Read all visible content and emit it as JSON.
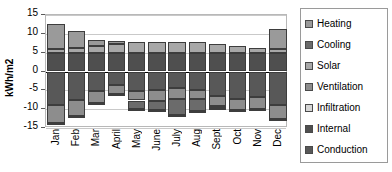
{
  "chart_data": {
    "type": "bar",
    "title": "",
    "subtitle": "",
    "xlabel": "",
    "ylabel": "kWh/m2",
    "stacked": true,
    "orientation": "vertical",
    "grid": true,
    "legend_position": "right",
    "ylim": [
      -15,
      15
    ],
    "yticks": [
      15,
      10,
      5,
      0,
      -5,
      -10,
      -15
    ],
    "ytick_labels": [
      "15",
      "10",
      "5",
      "0",
      "-5",
      "-10",
      "-15"
    ],
    "categories": [
      "Jan",
      "Feb",
      "Mar",
      "April",
      "May",
      "June",
      "July",
      "Aug",
      "Sept",
      "Oct",
      "Nov",
      "Dec"
    ],
    "series": [
      {
        "name": "Heating",
        "color": "#9a9a9a",
        "values": [
          6.7,
          4.5,
          1.7,
          0.8,
          0.0,
          0.0,
          0.0,
          0.0,
          0.0,
          0.0,
          0.0,
          5.4
        ]
      },
      {
        "name": "Cooling",
        "color": "#6b6b6b",
        "values": [
          0.0,
          0.0,
          0.0,
          0.0,
          -2.2,
          -2.3,
          -4.4,
          -3.2,
          -0.6,
          0.0,
          0.0,
          0.0
        ]
      },
      {
        "name": "Solar",
        "color": "#a8a8a8",
        "values": [
          1.0,
          1.3,
          1.8,
          2.4,
          2.8,
          2.9,
          3.0,
          2.9,
          2.5,
          2.0,
          1.4,
          1.0
        ]
      },
      {
        "name": "Ventilation",
        "color": "#8d8d8d",
        "values": [
          -4.9,
          -4.3,
          -3.1,
          -2.4,
          -2.4,
          -2.9,
          -2.8,
          -2.6,
          -2.6,
          -2.9,
          -3.2,
          -3.6
        ]
      },
      {
        "name": "Infiltration",
        "color": "#d6d6d6",
        "values": [
          -0.3,
          -0.3,
          -0.3,
          -0.3,
          -0.3,
          -0.3,
          -0.3,
          -0.3,
          -0.3,
          -0.3,
          -0.3,
          -0.3
        ]
      },
      {
        "name": "Internal",
        "color": "#4f4f4f",
        "values": [
          4.9,
          4.9,
          4.9,
          4.9,
          4.9,
          4.9,
          4.9,
          4.9,
          4.9,
          4.9,
          4.9,
          4.9
        ]
      },
      {
        "name": "Conduction",
        "color": "#585858",
        "values": [
          -8.9,
          -7.5,
          -5.2,
          -3.6,
          -5.3,
          -5.0,
          -4.4,
          -4.8,
          -6.5,
          -7.4,
          -6.7,
          -8.9
        ]
      }
    ],
    "stack_order_positive": [
      "Internal",
      "Solar",
      "Heating"
    ],
    "stack_order_negative": [
      "Conduction",
      "Ventilation",
      "Cooling",
      "Infiltration"
    ],
    "bar_totals_positive": [
      12.6,
      10.7,
      8.4,
      8.1,
      7.7,
      7.8,
      7.9,
      7.8,
      7.4,
      6.9,
      6.3,
      11.3
    ],
    "bar_totals_negative": [
      -14.1,
      -12.1,
      -8.6,
      -6.3,
      -10.2,
      -10.5,
      -11.9,
      -10.9,
      -9.4,
      -10.6,
      -10.2,
      -12.8
    ]
  },
  "axis": {
    "ylabel": "kWh/m2"
  },
  "legend": {
    "items": [
      {
        "label": "Heating",
        "color": "#9a9a9a",
        "icon": "legend-swatch-icon"
      },
      {
        "label": "Cooling",
        "color": "#6b6b6b",
        "icon": "legend-swatch-icon"
      },
      {
        "label": "Solar",
        "color": "#a8a8a8",
        "icon": "legend-swatch-icon"
      },
      {
        "label": "Ventilation",
        "color": "#8d8d8d",
        "icon": "legend-swatch-icon"
      },
      {
        "label": "Infiltration",
        "color": "#d6d6d6",
        "icon": "legend-swatch-icon"
      },
      {
        "label": "Internal",
        "color": "#4f4f4f",
        "icon": "legend-swatch-icon"
      },
      {
        "label": "Conduction",
        "color": "#585858",
        "icon": "legend-swatch-icon"
      }
    ]
  }
}
